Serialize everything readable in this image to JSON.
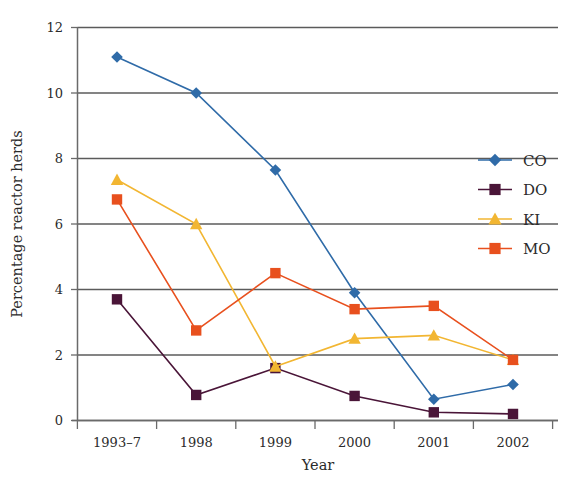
{
  "chart_data": {
    "type": "line",
    "title": "",
    "xlabel": "Year",
    "ylabel": "Percentage reactor herds",
    "categories": [
      "1993–7",
      "1998",
      "1999",
      "2000",
      "2001",
      "2002"
    ],
    "ylim": [
      0,
      12
    ],
    "yticks": [
      0,
      2,
      4,
      6,
      8,
      10,
      12
    ],
    "ytick_labels": [
      "0",
      "2",
      "4",
      "6",
      "8",
      "10",
      "12"
    ],
    "grid": "horizontal",
    "legend_position": "right",
    "series": [
      {
        "name": "CO",
        "color": "#2F6BA8",
        "marker": "diamond",
        "values": [
          11.1,
          10.0,
          7.65,
          3.9,
          0.65,
          1.1
        ]
      },
      {
        "name": "DO",
        "color": "#4A1538",
        "marker": "square",
        "values": [
          3.7,
          0.78,
          1.6,
          0.75,
          0.25,
          0.2
        ]
      },
      {
        "name": "KI",
        "color": "#F2B632",
        "marker": "triangle",
        "values": [
          7.35,
          6.0,
          1.65,
          2.5,
          2.6,
          1.85
        ]
      },
      {
        "name": "MO",
        "color": "#E8501E",
        "marker": "square",
        "values": [
          6.75,
          2.75,
          4.5,
          3.4,
          3.5,
          1.85
        ]
      }
    ]
  },
  "legend": {
    "items": [
      {
        "label": "CO"
      },
      {
        "label": "DO"
      },
      {
        "label": "KI"
      },
      {
        "label": "MO"
      }
    ]
  }
}
